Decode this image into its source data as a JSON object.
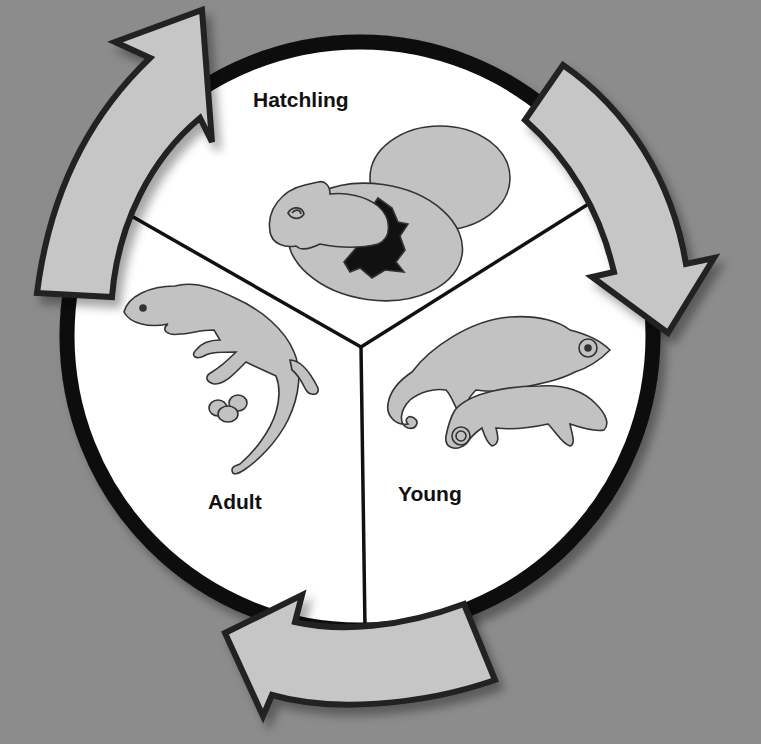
{
  "diagram": {
    "type": "life-cycle",
    "stages": [
      {
        "id": "hatchling",
        "label": "Hatchling",
        "illustration": "chameleon hatching from egg beside second egg"
      },
      {
        "id": "young",
        "label": "Young",
        "illustration": "two young chameleons with curled tails"
      },
      {
        "id": "adult",
        "label": "Adult",
        "illustration": "adult chameleon with three eggs"
      }
    ],
    "flow": [
      {
        "from": "adult",
        "to": "hatchling",
        "arrow": "left-arrow-up"
      },
      {
        "from": "hatchling",
        "to": "young",
        "arrow": "right-arrow-down"
      },
      {
        "from": "young",
        "to": "adult",
        "arrow": "bottom-arrow-left"
      }
    ],
    "colors": {
      "background": "#8c8c8c",
      "circle_fill": "#ffffff",
      "circle_border": "#0d0d0d",
      "arrow_fill": "#c6c6c6",
      "arrow_border": "#222222",
      "animal_fill": "#c2c2c2",
      "outline": "#333333",
      "label_text": "#111111"
    }
  }
}
